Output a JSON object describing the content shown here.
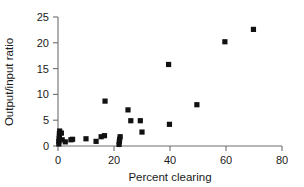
{
  "chart_data": {
    "type": "scatter",
    "title": "",
    "xlabel": "Percent clearing",
    "ylabel": "Output/input ratio",
    "xlim": [
      0,
      80
    ],
    "ylim": [
      0,
      25
    ],
    "xticks": [
      0,
      20,
      40,
      60,
      80
    ],
    "yticks": [
      0,
      5,
      10,
      15,
      20,
      25
    ],
    "xtick_labels": [
      "0",
      "20",
      "40",
      "60",
      "80"
    ],
    "ytick_labels": [
      "0",
      "5",
      "10",
      "15",
      "20",
      "25"
    ],
    "grid": false,
    "legend": null,
    "marker_style": "filled-square",
    "marker_color": "#111111",
    "points": [
      {
        "x": 0.3,
        "y": 0.4
      },
      {
        "x": 0.3,
        "y": 0.9
      },
      {
        "x": 0.4,
        "y": 1.4
      },
      {
        "x": 0.5,
        "y": 1.9
      },
      {
        "x": 0.5,
        "y": 2.4
      },
      {
        "x": 0.6,
        "y": 2.9
      },
      {
        "x": 1.2,
        "y": 2.5
      },
      {
        "x": 1.5,
        "y": 1.2
      },
      {
        "x": 2.6,
        "y": 0.8
      },
      {
        "x": 4.6,
        "y": 1.2
      },
      {
        "x": 5.2,
        "y": 1.3
      },
      {
        "x": 10.0,
        "y": 1.4
      },
      {
        "x": 13.6,
        "y": 0.9
      },
      {
        "x": 15.4,
        "y": 1.8
      },
      {
        "x": 16.6,
        "y": 2.0
      },
      {
        "x": 16.8,
        "y": 8.7
      },
      {
        "x": 21.8,
        "y": 0.3
      },
      {
        "x": 21.9,
        "y": 0.8
      },
      {
        "x": 22.0,
        "y": 1.3
      },
      {
        "x": 22.2,
        "y": 1.8
      },
      {
        "x": 25.0,
        "y": 7.0
      },
      {
        "x": 26.0,
        "y": 4.9
      },
      {
        "x": 29.4,
        "y": 4.9
      },
      {
        "x": 30.0,
        "y": 2.7
      },
      {
        "x": 39.5,
        "y": 15.8
      },
      {
        "x": 39.8,
        "y": 4.2
      },
      {
        "x": 49.6,
        "y": 8.0
      },
      {
        "x": 59.6,
        "y": 20.2
      },
      {
        "x": 69.8,
        "y": 22.6
      }
    ]
  },
  "axes": {
    "x_title": "Percent clearing",
    "y_title": "Output/input ratio"
  },
  "colors": {
    "marker": "#111111",
    "axis": "#6e6e6e",
    "text": "#1a1a1a",
    "background": "#ffffff"
  }
}
